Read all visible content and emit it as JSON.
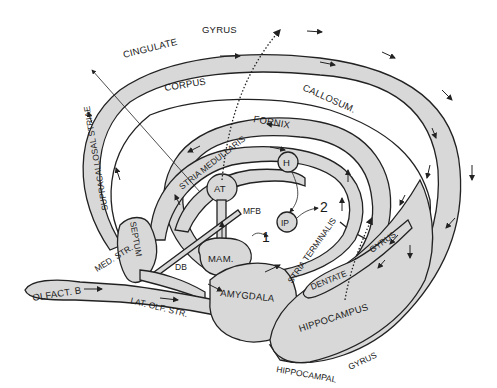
{
  "diagram": {
    "type": "neuroanatomy",
    "title": "",
    "colors": {
      "tract_fill": "#d8d8d8",
      "stroke": "#222222",
      "background": "#ffffff"
    },
    "labels": {
      "cingulate": "CINGULATE",
      "gyrus_top": "GYRUS",
      "corpus": "CORPUS",
      "callosum": "CALLOSUM.",
      "fornix": "FORNIX",
      "supracallosal": "SUPRACALLOSAL STRIAE",
      "stria_medullaris": "STRIA MEDULLARIS",
      "at": "AT",
      "h": "H",
      "ip": "IP",
      "mfb": "MFB",
      "mam": "MAM.",
      "septum": "SEPTUM",
      "med_str": "MED. STR.",
      "db": "DB",
      "olfact_b": "OLFACT. B",
      "lat_olf_str": "LAT. OLF. STR.",
      "amygdala": "AMYGDALA",
      "stria_terminalis": "STRIA TERMINALIS",
      "dentate": "DENTATE",
      "gyrus_dentate": "GYRUS",
      "hippocampus": "HIPPOCAMPUS",
      "hippocampal": "HIPPOCAMPAL",
      "gyrus_bottom": "GYRUS",
      "output_1": "1",
      "output_2": "2"
    }
  }
}
